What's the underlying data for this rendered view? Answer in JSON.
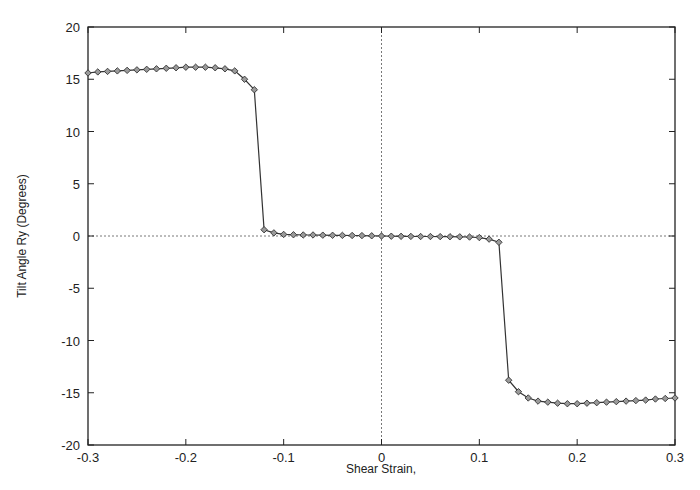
{
  "chart_data": {
    "type": "line",
    "title": "",
    "xlabel": "Shear Strain,",
    "ylabel": "Tilt Angle Ry (Degrees)",
    "xlim": [
      -0.3,
      0.3
    ],
    "ylim": [
      -20,
      20
    ],
    "xticks": [
      -0.3,
      -0.2,
      -0.1,
      0,
      0.1,
      0.2,
      0.3
    ],
    "xtick_labels": [
      "-0.3",
      "-0.2",
      "-0.1",
      "0",
      "0.1",
      "0.2",
      "0.3"
    ],
    "yticks": [
      -20,
      -15,
      -10,
      -5,
      0,
      5,
      10,
      15,
      20
    ],
    "ytick_labels": [
      "-20",
      "-15",
      "-10",
      "-5",
      "0",
      "5",
      "10",
      "15",
      "20"
    ],
    "grid": false,
    "zero_lines": true,
    "legend": null,
    "marker": "diamond",
    "series": [
      {
        "name": "Tilt Angle Ry",
        "x": [
          -0.3,
          -0.29,
          -0.28,
          -0.27,
          -0.26,
          -0.25,
          -0.24,
          -0.23,
          -0.22,
          -0.21,
          -0.2,
          -0.19,
          -0.18,
          -0.17,
          -0.16,
          -0.15,
          -0.14,
          -0.13,
          -0.12,
          -0.11,
          -0.1,
          -0.09,
          -0.08,
          -0.07,
          -0.06,
          -0.05,
          -0.04,
          -0.03,
          -0.02,
          -0.01,
          0.0,
          0.01,
          0.02,
          0.03,
          0.04,
          0.05,
          0.06,
          0.07,
          0.08,
          0.09,
          0.1,
          0.11,
          0.12,
          0.13,
          0.14,
          0.15,
          0.16,
          0.17,
          0.18,
          0.19,
          0.2,
          0.21,
          0.22,
          0.23,
          0.24,
          0.25,
          0.26,
          0.27,
          0.28,
          0.29,
          0.3
        ],
        "y": [
          15.6,
          15.7,
          15.75,
          15.8,
          15.85,
          15.9,
          15.95,
          16.0,
          16.05,
          16.1,
          16.15,
          16.15,
          16.15,
          16.1,
          16.0,
          15.8,
          15.0,
          14.0,
          0.6,
          0.3,
          0.15,
          0.12,
          0.1,
          0.1,
          0.08,
          0.07,
          0.06,
          0.05,
          0.04,
          0.02,
          0.0,
          -0.02,
          -0.03,
          -0.04,
          -0.05,
          -0.05,
          -0.06,
          -0.07,
          -0.08,
          -0.1,
          -0.15,
          -0.3,
          -0.6,
          -13.8,
          -14.9,
          -15.5,
          -15.8,
          -15.9,
          -16.0,
          -16.05,
          -16.05,
          -16.0,
          -15.95,
          -15.9,
          -15.85,
          -15.8,
          -15.75,
          -15.7,
          -15.6,
          -15.55,
          -15.5
        ]
      }
    ]
  }
}
